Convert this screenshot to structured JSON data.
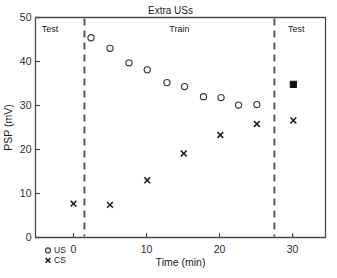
{
  "figure": {
    "title": "Extra USs",
    "phase_labels": [
      {
        "text": "Test",
        "x_center_min": -3.2
      },
      {
        "text": "Train",
        "x_center_min": 14.5
      },
      {
        "text": "Test",
        "x_center_min": 30.5
      }
    ],
    "legend": [
      {
        "marker": "open-circle-marker",
        "label": "US"
      },
      {
        "marker": "x-marker",
        "label": "CS"
      }
    ]
  },
  "chart_data": {
    "type": "scatter",
    "title": "Extra USs",
    "xlabel": "Time (min)",
    "ylabel": "PSP (mV)",
    "xlim": [
      -5.2,
      34.5
    ],
    "ylim": [
      0,
      50
    ],
    "xticks": [
      0,
      10,
      20,
      30
    ],
    "yticks": [
      0,
      10,
      20,
      30,
      40,
      50
    ],
    "xtick_labels": [
      "0",
      "10",
      "20",
      "30"
    ],
    "ytick_labels": [
      "0",
      "10",
      "20",
      "30",
      "40",
      "50"
    ],
    "grid": false,
    "legend_position": "below-left-outside",
    "phase_dividers": [
      1.5,
      27.5
    ],
    "series": [
      {
        "name": "US",
        "marker": "open-circle",
        "points": [
          {
            "x": 2.4,
            "y": 45.4
          },
          {
            "x": 5.0,
            "y": 43.0
          },
          {
            "x": 7.6,
            "y": 39.7
          },
          {
            "x": 10.1,
            "y": 38.1
          },
          {
            "x": 12.8,
            "y": 35.2
          },
          {
            "x": 15.2,
            "y": 34.3
          },
          {
            "x": 17.8,
            "y": 32.0
          },
          {
            "x": 20.2,
            "y": 31.8
          },
          {
            "x": 22.6,
            "y": 30.1
          },
          {
            "x": 25.1,
            "y": 30.2
          }
        ]
      },
      {
        "name": "CS",
        "marker": "x",
        "points": [
          {
            "x": 0.0,
            "y": 7.7
          },
          {
            "x": 5.0,
            "y": 7.4
          },
          {
            "x": 10.1,
            "y": 13.0
          },
          {
            "x": 15.1,
            "y": 19.1
          },
          {
            "x": 20.1,
            "y": 23.3
          },
          {
            "x": 25.1,
            "y": 25.8
          },
          {
            "x": 30.1,
            "y": 26.6
          }
        ]
      },
      {
        "name": "US test",
        "marker": "filled-square",
        "points": [
          {
            "x": 30.1,
            "y": 34.8
          }
        ]
      }
    ]
  }
}
